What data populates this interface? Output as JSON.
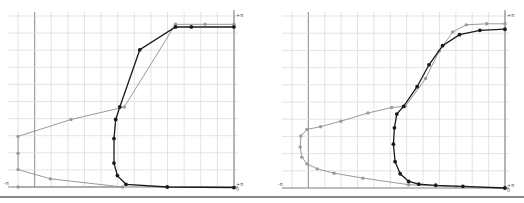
{
  "chart_data": [
    {
      "type": "line",
      "title": "",
      "panel": "left",
      "xlabel": "",
      "ylabel": "",
      "axis_labels": {
        "x_min": "-π",
        "x_max": "+π",
        "y_min": "0",
        "y_max": "+π"
      },
      "xlim": [
        -3.1416,
        3.1416
      ],
      "ylim": [
        0,
        3.1416
      ],
      "grid": true,
      "series": [
        {
          "name": "grey",
          "color": "#9a9a9a",
          "points": [
            [
              -3.14,
              0.0
            ],
            [
              -0.1,
              0.0
            ],
            [
              -2.2,
              0.15
            ],
            [
              -3.14,
              0.32
            ],
            [
              -3.14,
              0.62
            ],
            [
              -3.14,
              0.93
            ],
            [
              -1.6,
              1.24
            ],
            [
              -0.05,
              1.47
            ],
            [
              1.44,
              2.99
            ],
            [
              2.3,
              2.99
            ],
            [
              3.14,
              2.99
            ]
          ]
        },
        {
          "name": "black",
          "color": "#1a1a1a",
          "points": [
            [
              3.14,
              -0.01
            ],
            [
              1.2,
              0.0
            ],
            [
              0.0,
              0.05
            ],
            [
              -0.25,
              0.21
            ],
            [
              -0.35,
              0.44
            ],
            [
              -0.35,
              0.89
            ],
            [
              -0.3,
              1.24
            ],
            [
              -0.18,
              1.47
            ],
            [
              0.4,
              2.52
            ],
            [
              1.44,
              2.94
            ],
            [
              1.9,
              2.94
            ],
            [
              3.14,
              2.94
            ]
          ]
        }
      ]
    },
    {
      "type": "line",
      "title": "",
      "panel": "right",
      "xlabel": "",
      "ylabel": "",
      "axis_labels": {
        "x_min": "-π",
        "x_max": "+π",
        "y_min": "0",
        "y_max": "+π"
      },
      "xlim": [
        -3.1416,
        3.1416
      ],
      "ylim": [
        0,
        3.1416
      ],
      "grid": true,
      "series": [
        {
          "name": "grey",
          "color": "#9a9a9a",
          "points": [
            [
              3.14,
              0.0
            ],
            [
              1.7,
              0.02
            ],
            [
              0.3,
              0.06
            ],
            [
              -1.05,
              0.18
            ],
            [
              -1.9,
              0.27
            ],
            [
              -2.4,
              0.35
            ],
            [
              -2.7,
              0.44
            ],
            [
              -2.85,
              0.56
            ],
            [
              -2.9,
              0.75
            ],
            [
              -2.88,
              0.95
            ],
            [
              -2.7,
              1.07
            ],
            [
              -2.3,
              1.12
            ],
            [
              -1.7,
              1.22
            ],
            [
              -0.9,
              1.37
            ],
            [
              -0.2,
              1.47
            ],
            [
              0.2,
              1.49
            ],
            [
              0.8,
              2.0
            ],
            [
              1.2,
              2.5
            ],
            [
              1.6,
              2.85
            ],
            [
              2.0,
              2.98
            ],
            [
              2.6,
              3.0
            ],
            [
              3.14,
              3.0
            ]
          ]
        },
        {
          "name": "black",
          "color": "#1a1a1a",
          "points": [
            [
              3.14,
              0.0
            ],
            [
              1.9,
              0.03
            ],
            [
              1.1,
              0.05
            ],
            [
              0.6,
              0.07
            ],
            [
              0.3,
              0.12
            ],
            [
              0.05,
              0.26
            ],
            [
              -0.1,
              0.48
            ],
            [
              -0.15,
              0.8
            ],
            [
              -0.12,
              1.1
            ],
            [
              -0.05,
              1.35
            ],
            [
              0.15,
              1.49
            ],
            [
              0.55,
              1.85
            ],
            [
              0.9,
              2.25
            ],
            [
              1.3,
              2.6
            ],
            [
              1.8,
              2.8
            ],
            [
              2.4,
              2.88
            ],
            [
              3.14,
              2.9
            ]
          ]
        }
      ]
    }
  ]
}
